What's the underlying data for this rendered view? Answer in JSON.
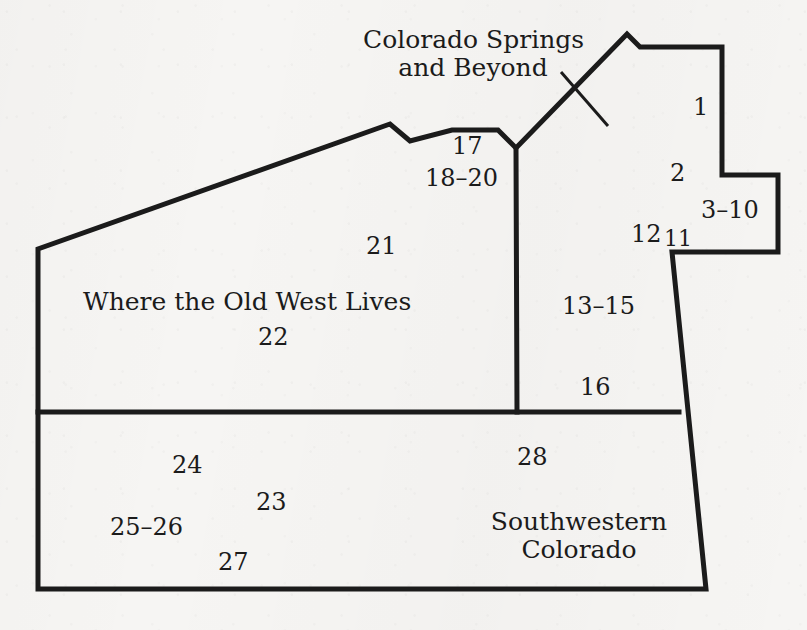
{
  "figure": {
    "kind": "regional-map-outline",
    "ink_color": "#1b1b1b",
    "paper_color": "#f6f5f3",
    "width": 807,
    "height": 630
  },
  "region_titles": {
    "colorado_springs": "Colorado Springs\nand Beyond",
    "colorado_springs_line1": "Colorado Springs",
    "colorado_springs_line2": "and Beyond",
    "old_west": "Where the Old West Lives",
    "southwestern_line1": "Southwestern",
    "southwestern_line2": "Colorado"
  },
  "chapter_numbers": {
    "n1": "1",
    "n2": "2",
    "n3_10": "3–10",
    "n11": "11",
    "n12": "12",
    "n13_15": "13–15",
    "n16": "16",
    "n17": "17",
    "n18_20": "18–20",
    "n21": "21",
    "n22": "22",
    "n23": "23",
    "n24": "24",
    "n25_26": "25–26",
    "n27": "27",
    "n28": "28"
  }
}
